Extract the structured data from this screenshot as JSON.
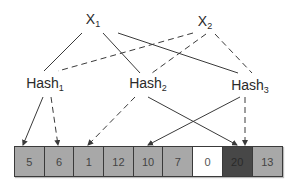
{
  "inputs": [
    {
      "label": "X",
      "sub": "1",
      "x": 93,
      "y": 20
    },
    {
      "label": "X",
      "sub": "2",
      "x": 205,
      "y": 22
    }
  ],
  "hashes": [
    {
      "label": "Hash",
      "sub": "1",
      "x": 45,
      "y": 84
    },
    {
      "label": "Hash",
      "sub": "2",
      "x": 148,
      "y": 84
    },
    {
      "label": "Hash",
      "sub": "3",
      "x": 250,
      "y": 86
    }
  ],
  "array": {
    "cells": [
      {
        "value": "5",
        "color": "#a8a8a8",
        "text": "#444444"
      },
      {
        "value": "6",
        "color": "#a8a8a8",
        "text": "#444444"
      },
      {
        "value": "1",
        "color": "#a8a8a8",
        "text": "#444444"
      },
      {
        "value": "12",
        "color": "#a8a8a8",
        "text": "#444444"
      },
      {
        "value": "10",
        "color": "#a8a8a8",
        "text": "#444444"
      },
      {
        "value": "7",
        "color": "#a8a8a8",
        "text": "#444444"
      },
      {
        "value": "0",
        "color": "#ffffff",
        "text": "#555555"
      },
      {
        "value": "20",
        "color": "#474747",
        "text": "#2a2a2a"
      },
      {
        "value": "13",
        "color": "#a8a8a8",
        "text": "#444444"
      }
    ]
  },
  "edges": [
    {
      "from": "X1",
      "to": "Hash1",
      "style": "solid"
    },
    {
      "from": "X1",
      "to": "Hash2",
      "style": "solid"
    },
    {
      "from": "X1",
      "to": "Hash3",
      "style": "solid"
    },
    {
      "from": "X2",
      "to": "Hash1",
      "style": "dashed"
    },
    {
      "from": "X2",
      "to": "Hash2",
      "style": "dashed"
    },
    {
      "from": "X2",
      "to": "Hash3",
      "style": "dashed"
    },
    {
      "from": "Hash1",
      "to": "cell-5",
      "style": "solid"
    },
    {
      "from": "Hash1",
      "to": "cell-6",
      "style": "dashed"
    },
    {
      "from": "Hash2",
      "to": "cell-1",
      "style": "dashed"
    },
    {
      "from": "Hash2",
      "to": "cell-20",
      "style": "solid"
    },
    {
      "from": "Hash3",
      "to": "cell-10",
      "style": "solid"
    },
    {
      "from": "Hash3",
      "to": "cell-20",
      "style": "dashed"
    }
  ],
  "colors": {
    "line": "#3a3a3a",
    "cell_gray": "#a8a8a8",
    "cell_dark": "#474747",
    "cell_white": "#ffffff"
  }
}
